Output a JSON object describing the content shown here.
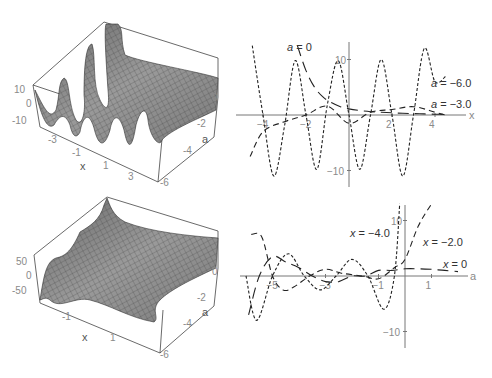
{
  "figure": {
    "panels": [
      "top-left-surface",
      "top-right-sections",
      "bottom-left-surface",
      "bottom-right-sections"
    ]
  },
  "chart_data": [
    {
      "id": "surface-top",
      "type": "surface3d",
      "title": "",
      "xlabel": "x",
      "ylabel": "a",
      "zlabel": "",
      "x_ticks": [
        "-3",
        "-1",
        "1",
        "3"
      ],
      "a_ticks": [
        "0",
        "-2",
        "-4",
        "-6"
      ],
      "z_ticks": [
        "10",
        "0",
        "-10"
      ],
      "xlim": [
        -4,
        4.5
      ],
      "alim": [
        -6,
        0
      ],
      "zlim": [
        -10,
        10
      ],
      "description": "oscillating ridges along x, decaying toward a = 0"
    },
    {
      "id": "sections-a",
      "type": "line",
      "xlabel": "x",
      "ylabel": "",
      "x_ticks": [
        "-4",
        "-2",
        "2",
        "4"
      ],
      "y_ticks": [
        "10",
        "-10"
      ],
      "xlim": [
        -4.5,
        4.6
      ],
      "ylim": [
        -12,
        12
      ],
      "series": [
        {
          "name": "a = 0",
          "label_var": "a",
          "label_val": "= 0",
          "style": "long-dash",
          "x": [
            -2.4,
            -2.0,
            -1.6,
            -1.2,
            -0.8,
            -0.4,
            0,
            0.5,
            1,
            1.5,
            2,
            2.5,
            3,
            3.5,
            4,
            4.5
          ],
          "y": [
            12.5,
            8.0,
            5.0,
            3.2,
            2.2,
            1.5,
            1.1,
            0.8,
            0.6,
            0.5,
            0.4,
            0.3,
            0.25,
            0.2,
            0.15,
            0.1
          ]
        },
        {
          "name": "a = -6.0",
          "label_var": "a",
          "label_val": "= −6.0",
          "style": "short-dash",
          "x": [
            -4.5,
            -4.0,
            -3.5,
            -3.0,
            -2.5,
            -2.0,
            -1.5,
            -1.0,
            -0.5,
            0,
            0.5,
            1.0,
            1.5,
            2.0,
            2.5,
            3.0,
            3.5,
            4.0,
            4.5
          ],
          "y": [
            12.5,
            0,
            -11,
            -2,
            9.8,
            0,
            -9.8,
            2,
            9.8,
            0,
            -9.8,
            0,
            10,
            0,
            -11,
            0,
            12,
            6,
            7
          ]
        },
        {
          "name": "a = -3.0",
          "label_var": "a",
          "label_val": "= −3.0",
          "style": "medium-dash",
          "x": [
            -4.6,
            -4.0,
            -3.0,
            -2.0,
            -1.0,
            0,
            1.0,
            2.0,
            3.0,
            4.0,
            4.5
          ],
          "y": [
            -7.5,
            -3.0,
            -1.2,
            0,
            1.6,
            -1.5,
            0.5,
            1.0,
            1.5,
            0.5,
            0
          ]
        }
      ]
    },
    {
      "id": "surface-bottom",
      "type": "surface3d",
      "title": "",
      "xlabel": "x",
      "ylabel": "a",
      "zlabel": "",
      "x_ticks": [
        "-1",
        "1"
      ],
      "a_ticks": [
        "0",
        "-2",
        "-4",
        "-6"
      ],
      "z_ticks": [
        "50",
        "0",
        "-50"
      ],
      "xlim": [
        -2.5,
        2.5
      ],
      "alim": [
        -6,
        0
      ],
      "zlim": [
        -50,
        50
      ],
      "description": "mostly flat sheet with sharp peak near x = -2, a = 0 and a dip at far corner"
    },
    {
      "id": "sections-x",
      "type": "line",
      "xlabel": "a",
      "ylabel": "",
      "x_ticks": [
        "-5",
        "-3",
        "-1",
        "1"
      ],
      "y_ticks": [
        "10",
        "-10"
      ],
      "xlim": [
        -6.0,
        2.0
      ],
      "ylim": [
        -13,
        13
      ],
      "series": [
        {
          "name": "x = -4.0",
          "label_var": "x",
          "label_val": "= −4.0",
          "style": "short-dash",
          "x": [
            -6.0,
            -5.6,
            -5.0,
            -4.4,
            -3.8,
            -3.2,
            -2.6,
            -2.0,
            -1.4,
            -0.8,
            -0.4,
            -0.2
          ],
          "y": [
            0,
            -8,
            0,
            4,
            0,
            -2.5,
            0,
            3,
            0,
            -6,
            0,
            13
          ]
        },
        {
          "name": "x = -2.0",
          "label_var": "x",
          "label_val": "= −2.0",
          "style": "medium-dash",
          "x": [
            -5.8,
            -5.4,
            -5.0,
            -4.6,
            -4.2,
            -3.6,
            -3.0,
            -2.4,
            -1.6,
            -1.0,
            -0.4,
            0,
            0.5,
            1.0
          ],
          "y": [
            7.5,
            7,
            0,
            -2.5,
            -2,
            0,
            1.2,
            0.5,
            0,
            -0.5,
            1.5,
            3,
            9,
            13
          ]
        },
        {
          "name": "x = 0",
          "label_var": "x",
          "label_val": "= 0",
          "style": "long-dash",
          "x": [
            -5.9,
            -5.5,
            -5.0,
            -4.5,
            -4.0,
            -3.5,
            -3.0,
            -2.5,
            -2.0,
            -1.5,
            -1.0,
            -0.5,
            0,
            0.5,
            1.0,
            1.5,
            2.0
          ],
          "y": [
            -7,
            0,
            3.5,
            2.5,
            1.5,
            0,
            -1,
            -1,
            0,
            0,
            1,
            1,
            1.3,
            1.3,
            1.2,
            1.0,
            0.8
          ]
        }
      ]
    }
  ]
}
